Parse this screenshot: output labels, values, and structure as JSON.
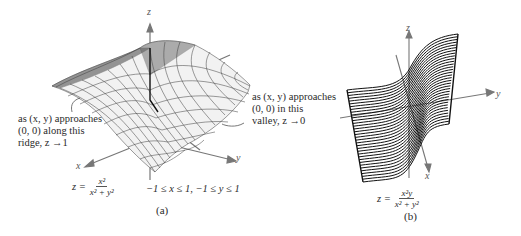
{
  "figure_a": {
    "caption": "(a)",
    "axes": {
      "z": "z",
      "x": "x",
      "y": "y"
    },
    "annotation_left": {
      "line1": "as (x, y) approaches",
      "line2": "(0, 0) along this",
      "line3": "ridge, z →1"
    },
    "annotation_right": {
      "line1": "as (x, y) approaches",
      "line2": "(0, 0) in this",
      "line3": "valley, z →0"
    },
    "equation": {
      "lhs": "z =",
      "numerator": "x²",
      "denominator": "x² + y²"
    },
    "domain": "−1 ≤ x ≤ 1, −1 ≤ y ≤ 1"
  },
  "figure_b": {
    "caption": "(b)",
    "axes": {
      "z": "z",
      "x": "x",
      "y": "y"
    },
    "equation": {
      "lhs": "z =",
      "numerator": "x²y",
      "denominator": "x² + y²"
    }
  },
  "colors": {
    "mesh": "#3a3a3a",
    "axis": "#777777",
    "text": "#2a2a2a"
  }
}
